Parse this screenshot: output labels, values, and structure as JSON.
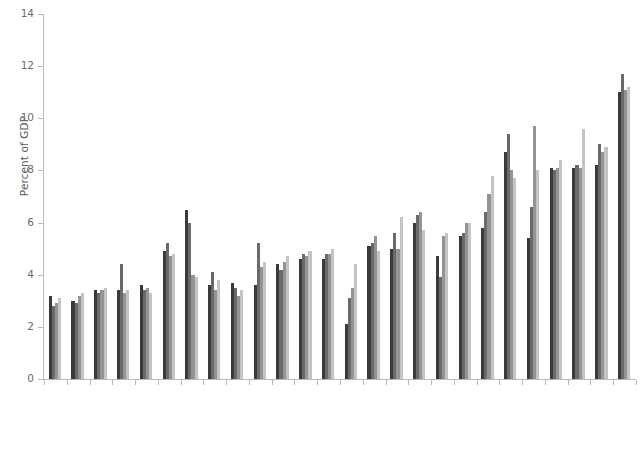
{
  "chart_data": {
    "type": "bar",
    "title": "",
    "xlabel": "",
    "ylabel": "Percent of GDP",
    "ylim": [
      0,
      14
    ],
    "yticks": [
      0,
      2,
      4,
      6,
      8,
      10,
      12,
      14
    ],
    "ytick_labels": [
      "0",
      "2",
      "4",
      "6",
      "8",
      "10",
      "12",
      "14"
    ],
    "grid": false,
    "legend_position": "none",
    "categories": [
      "Pakistan",
      "Bangladesh",
      "Syrian Arab Republic",
      "Angola",
      "Sri Lanka",
      "Ghana",
      "Bhutan",
      "Nigeria",
      "Mauritania",
      "Cameroon",
      "India",
      "Cabo Verde",
      "Zambia",
      "Congo, Rep.",
      "Yemen, Rep.",
      "Egypt, Arab Rep.",
      "Côte d'Ivoire",
      "Kenya",
      "Morocco",
      "Tunisia",
      "Jordan",
      "São Tomé and Príncipe",
      "Sudan",
      "Eswatini",
      "Djibouti",
      "Lesotho"
    ],
    "series": [
      {
        "name": "series-1",
        "color": "#3a3a3a",
        "values": [
          3.2,
          3.0,
          3.4,
          3.4,
          3.6,
          4.9,
          6.5,
          3.6,
          3.7,
          3.6,
          4.4,
          4.6,
          4.6,
          2.1,
          5.1,
          5.0,
          6.0,
          4.7,
          5.5,
          5.8,
          8.7,
          5.4,
          8.1,
          8.1,
          8.2,
          11.0
        ],
        "shade": "#3a3a3a"
      },
      {
        "name": "series-2",
        "color": "#6a6a6a",
        "values": [
          2.8,
          2.9,
          3.3,
          4.4,
          3.4,
          5.2,
          6.0,
          4.1,
          3.5,
          5.2,
          4.2,
          4.8,
          4.8,
          3.1,
          5.2,
          5.6,
          6.3,
          3.9,
          5.6,
          6.4,
          9.4,
          6.6,
          8.0,
          8.2,
          9.0,
          11.7
        ],
        "shade": "#6a6a6a"
      },
      {
        "name": "series-3",
        "color": "#949494",
        "values": [
          2.9,
          3.2,
          3.4,
          3.3,
          3.5,
          4.7,
          4.0,
          3.4,
          3.2,
          4.3,
          4.5,
          4.7,
          4.8,
          3.5,
          5.5,
          5.0,
          6.4,
          5.5,
          6.0,
          7.1,
          8.0,
          9.7,
          8.1,
          8.1,
          8.7,
          11.1
        ],
        "shade": "#949494"
      },
      {
        "name": "series-4",
        "color": "#c4c4c4",
        "values": [
          3.1,
          3.3,
          3.5,
          3.4,
          3.3,
          4.8,
          3.9,
          3.8,
          3.4,
          4.5,
          4.7,
          4.9,
          5.0,
          4.4,
          4.9,
          6.2,
          5.7,
          5.6,
          6.0,
          7.8,
          7.7,
          8.0,
          8.4,
          9.6,
          8.9,
          11.2
        ],
        "shade": "#c4c4c4"
      }
    ]
  },
  "axes": {
    "y_label": "Percent of GDP"
  }
}
